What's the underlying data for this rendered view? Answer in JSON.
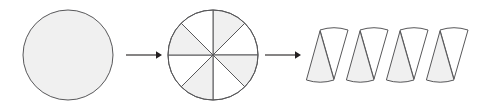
{
  "figure": {
    "width": 482,
    "height": 108,
    "background_color": "#ffffff",
    "stroke_color": "#58585a",
    "fill_shaded": "#f0f0f0",
    "fill_unshaded": "#ffffff",
    "stroke_width": 1
  },
  "stages": [
    {
      "name": "whole-circle",
      "label": "whole circle",
      "center_x": 68,
      "center_y": 55,
      "radius": 45,
      "fill": "#f0f0f0"
    },
    {
      "name": "divided-circle",
      "label": "circle divided into 8 equal sectors",
      "center_x": 213,
      "center_y": 55,
      "radius": 45,
      "sector_count": 8,
      "sector_angle_deg": 45,
      "shaded_indices": [
        0,
        2,
        4,
        6
      ]
    },
    {
      "name": "rearranged-sectors",
      "label": "sectors rearranged into a parallelogram",
      "left_x": 308,
      "right_x": 470,
      "top_y": 30,
      "bottom_y": 80,
      "sector_count": 8,
      "pairs": 4,
      "pair_width": 40,
      "skew_x": 12,
      "shaded_orientation": "point-up",
      "unshaded_orientation": "point-down"
    }
  ],
  "arrows": [
    {
      "name": "arrow-one",
      "label": "becomes",
      "x1": 126,
      "x2": 162,
      "y": 55,
      "head_size": 6
    },
    {
      "name": "arrow-two",
      "label": "becomes",
      "x1": 265,
      "x2": 301,
      "y": 55,
      "head_size": 6
    }
  ]
}
